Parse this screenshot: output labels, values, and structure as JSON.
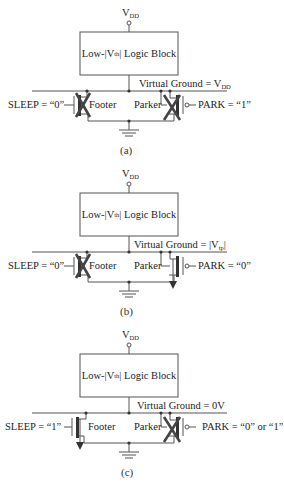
{
  "figure": {
    "panels": [
      {
        "id": "a",
        "caption": "(a)",
        "supply": {
          "label": "V",
          "sub": "DD"
        },
        "logic_block": {
          "prefix": "Low-|V",
          "sub": "th",
          "suffix": "| Logic Block"
        },
        "virtual_ground": {
          "prefix": "Virtual Ground = V",
          "sub": "DD",
          "suffix": ""
        },
        "sleep_label": "SLEEP = “0”",
        "park_label": "PARK = “1”",
        "footer_label": "Footer",
        "parker_label": "Parker",
        "footer_state": "off",
        "parker_state": "off"
      },
      {
        "id": "b",
        "caption": "(b)",
        "supply": {
          "label": "V",
          "sub": "DD"
        },
        "logic_block": {
          "prefix": "Low-|V",
          "sub": "th",
          "suffix": "| Logic Block"
        },
        "virtual_ground": {
          "prefix": "Virtual Ground = |V",
          "sub": "tp",
          "suffix": "|"
        },
        "sleep_label": "SLEEP = “0”",
        "park_label": "PARK = “0”",
        "footer_label": "Footer",
        "parker_label": "Parker",
        "footer_state": "off",
        "parker_state": "on"
      },
      {
        "id": "c",
        "caption": "(c)",
        "supply": {
          "label": "V",
          "sub": "DD"
        },
        "logic_block": {
          "prefix": "Low-|V",
          "sub": "th",
          "suffix": "| Logic Block"
        },
        "virtual_ground": {
          "prefix": "Virtual Ground = 0V",
          "sub": "",
          "suffix": ""
        },
        "sleep_label": "SLEEP = “1”",
        "park_label": "PARK = “0” or “1”",
        "footer_label": "Footer",
        "parker_label": "Parker",
        "footer_state": "on",
        "parker_state": "off"
      }
    ],
    "colors": {
      "line": "#555555",
      "device": "#333333",
      "cross": "#444444",
      "text": "#222222"
    }
  }
}
